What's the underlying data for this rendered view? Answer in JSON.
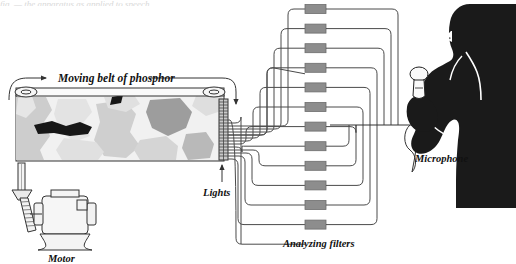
{
  "figure": {
    "type": "schematic-diagram",
    "background_color": "#ffffff",
    "ink_color": "#111111",
    "line_color": "#555555",
    "cut_off_caption_top": "fig. — the apparatus as applied to speech"
  },
  "labels": {
    "belt": "Moving belt of phosphor",
    "lights": "Lights",
    "filters": "Analyzing filters",
    "microphone": "Microphone",
    "motor": "Motor"
  },
  "belt": {
    "x": 16,
    "y": 95,
    "width": 208,
    "height": 66,
    "fill": "#f1f1f1",
    "roller_left_x": 24,
    "roller_right_x": 216,
    "patch_colors": [
      "#cccccc",
      "#e4e4e4",
      "#9d9d9d",
      "#171717"
    ],
    "patches": [
      {
        "color": "#cdcdcd",
        "d": "M16,97 L46,97 L52,110 L44,122 L50,136 L40,150 L44,160 L16,160 Z"
      },
      {
        "color": "#e3e3e3",
        "d": "M58,99 L86,99 L92,112 L82,124 L90,136 L74,142 L60,130 L54,114 Z"
      },
      {
        "color": "#cfcfcf",
        "d": "M96,104 L124,100 L136,114 L130,132 L140,146 L126,158 L104,156 L94,140 L100,122 Z"
      },
      {
        "color": "#e0e0e0",
        "d": "M64,138 L96,142 L104,152 L98,160 L62,160 L56,150 Z"
      },
      {
        "color": "#9d9d9d",
        "d": "M150,100 L180,98 L192,112 L186,128 L168,136 L152,128 L146,112 Z"
      },
      {
        "color": "#d5d5d5",
        "d": "M140,140 L166,136 L178,146 L176,160 L140,160 L134,150 Z"
      },
      {
        "color": "#b9b9b9",
        "d": "M186,134 L206,132 L214,144 L210,158 L188,160 L182,148 Z"
      },
      {
        "color": "#e2e2e2",
        "d": "M18,98 L32,96 L36,108 L26,118 L16,114 Z"
      },
      {
        "color": "#171717",
        "d": "M34,125 L52,121 L66,126 L80,122 L92,127 L88,134 L70,136 L54,133 L38,134 Z"
      },
      {
        "color": "#171717",
        "d": "M112,98 L122,96 L120,104 L110,106 Z"
      }
    ]
  },
  "lights": {
    "x": 219,
    "y": 99,
    "width": 9,
    "height": 60,
    "count": 22,
    "fill": "#c9c9c9"
  },
  "filters": {
    "count": 12,
    "x": 305,
    "width": 21,
    "height": 9,
    "first_y": 9,
    "spacing": 19.6,
    "fill": "#8d8d8d",
    "stroke": "#6d6d6d"
  },
  "wiring": {
    "input_fan_x_start": 229,
    "input_corner_xs": [
      236,
      243,
      250,
      257,
      264,
      271,
      278,
      285,
      264,
      255,
      246,
      238
    ],
    "output_corner_xs": [
      398,
      391,
      384,
      377,
      370,
      363,
      356,
      349,
      356,
      363,
      370,
      377
    ],
    "bus_y": 125,
    "arrow_tip_x": 437,
    "stroke": "#4a4a4a",
    "stroke_width": 1
  },
  "motor": {
    "body_x": 46,
    "body_y": 198,
    "body_w": 42,
    "body_h": 34,
    "base_y": 232,
    "shaft_x": 20,
    "belt_top_y": 164
  },
  "person": {
    "silhouette_color": "#1a1a1a",
    "mic_stand_x": 419,
    "mic_head_y": 74
  }
}
